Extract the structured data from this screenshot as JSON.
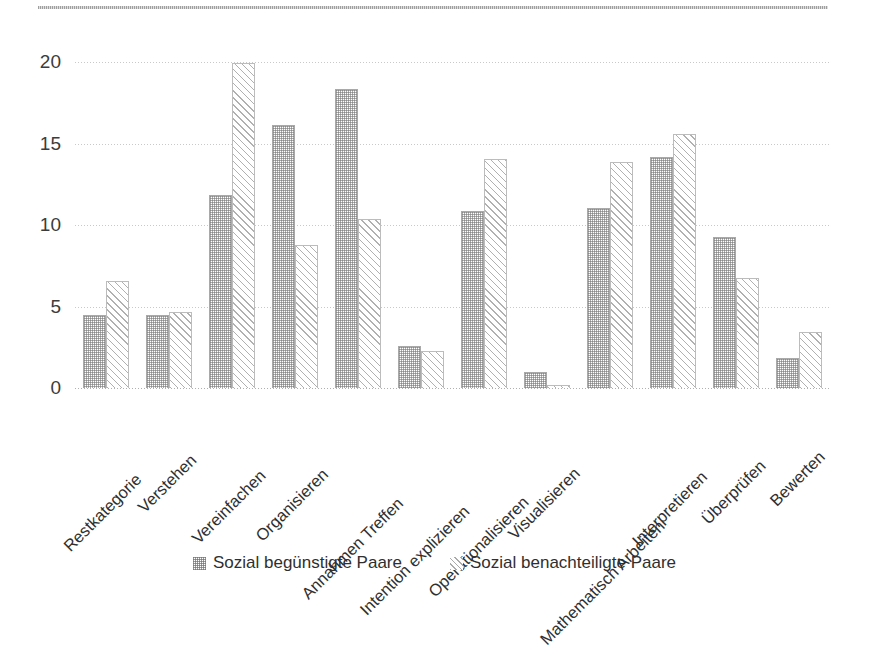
{
  "chart_data": {
    "type": "bar",
    "title": "",
    "subtitle": "",
    "xlabel": "",
    "ylabel": "",
    "ylim": [
      0,
      20
    ],
    "yticks": [
      0,
      5,
      10,
      15,
      20
    ],
    "grid": true,
    "legend_position": "bottom",
    "categories": [
      "Restkategorie",
      "Verstehen",
      "Vereinfachen",
      "Organisieren",
      "Annahmen Treffen",
      "Intention explizieren",
      "Operationalisieren",
      "Visualisieren",
      "Mathematisch Arbeiten",
      "Interpretieren",
      "Überprüfen",
      "Bewerten"
    ],
    "series": [
      {
        "name": "Sozial begünstigte Paare",
        "pattern": "dotted-checker",
        "color": "#7a7a7a",
        "values": [
          4.4,
          4.4,
          11.8,
          16.1,
          18.3,
          2.5,
          10.8,
          0.9,
          11.0,
          14.1,
          9.2,
          1.8
        ]
      },
      {
        "name": "Sozial benachteiligte Paare",
        "pattern": "diagonal-hatch",
        "color": "#b4b4b4",
        "values": [
          6.5,
          4.6,
          19.9,
          8.7,
          10.3,
          2.2,
          14.0,
          0.1,
          13.8,
          15.5,
          6.7,
          3.4
        ]
      }
    ]
  },
  "axis": {
    "y_tick_labels": [
      "20",
      "15",
      "10",
      "5",
      "0"
    ]
  },
  "legend": {
    "items": [
      {
        "label": "Sozial begünstigte Paare",
        "swatch": "dotted-checker-swatch"
      },
      {
        "label": "Sozial benachteiligte Paare",
        "swatch": "diagonal-hatch-swatch"
      }
    ]
  }
}
